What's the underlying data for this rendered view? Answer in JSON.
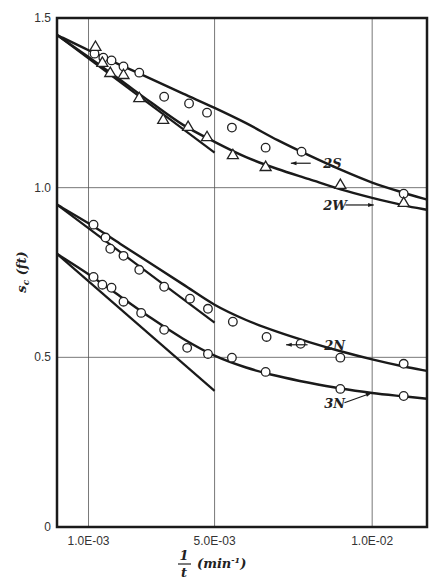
{
  "chart_data": {
    "type": "scatter",
    "title": "",
    "xlabel": "1/t (min^-1)",
    "xlabel_parts": {
      "numerator": "1",
      "denominator": "t",
      "unit": "(min",
      "exponent": "-1",
      "close": ")"
    },
    "ylabel": "s_c (ft)",
    "ylabel_parts": {
      "main": "s",
      "sub": "c",
      "unit": " (ft)"
    },
    "xlim": [
      0.0,
      0.01174
    ],
    "ylim": [
      0,
      1.5
    ],
    "grid": true,
    "x_ticks": [
      {
        "value": 0.001,
        "label": "1.0E-03"
      },
      {
        "value": 0.005,
        "label": "5.0E-03"
      },
      {
        "value": 0.01,
        "label": "1.0E-02"
      }
    ],
    "y_ticks": [
      {
        "value": 0,
        "label": "0"
      },
      {
        "value": 0.5,
        "label": "0.5"
      },
      {
        "value": 1.0,
        "label": "1.0"
      },
      {
        "value": 1.5,
        "label": "1.5"
      }
    ],
    "series": [
      {
        "name": "2S",
        "marker": "circle",
        "x": [
          0.00119,
          0.00147,
          0.00173,
          0.00211,
          0.00261,
          0.0034,
          0.00419,
          0.00476,
          0.00555,
          0.00662,
          0.00776,
          0.011
        ],
        "y": [
          1.395,
          1.383,
          1.375,
          1.357,
          1.339,
          1.268,
          1.248,
          1.221,
          1.177,
          1.118,
          1.106,
          0.982
        ],
        "curve": {
          "x": [
            0.0,
            0.001,
            0.002,
            0.003,
            0.004,
            0.005,
            0.006,
            0.007,
            0.008,
            0.009,
            0.01,
            0.011,
            0.01174
          ],
          "y": [
            1.45,
            1.405,
            1.362,
            1.32,
            1.277,
            1.235,
            1.19,
            1.14,
            1.095,
            1.053,
            1.015,
            0.985,
            0.965
          ]
        },
        "label_pos": {
          "x": 0.00845,
          "y": 1.072
        },
        "arrow": {
          "from": [
            0.00805,
            1.072
          ],
          "to": [
            0.00742,
            1.072
          ]
        }
      },
      {
        "name": "2W",
        "marker": "triangle",
        "x": [
          0.00122,
          0.00144,
          0.00169,
          0.00211,
          0.00261,
          0.00337,
          0.00416,
          0.00476,
          0.00558,
          0.00662,
          0.00899,
          0.011
        ],
        "y": [
          1.416,
          1.369,
          1.339,
          1.333,
          1.265,
          1.201,
          1.18,
          1.15,
          1.097,
          1.062,
          1.009,
          0.956
        ],
        "curve": {
          "x": [
            0.0,
            0.001,
            0.002,
            0.003,
            0.004,
            0.005,
            0.006,
            0.007,
            0.008,
            0.009,
            0.01,
            0.011,
            0.01174
          ],
          "y": [
            1.45,
            1.385,
            1.318,
            1.25,
            1.185,
            1.135,
            1.09,
            1.055,
            1.025,
            0.995,
            0.97,
            0.948,
            0.935
          ]
        },
        "label_pos": {
          "x": 0.00845,
          "y": 0.949
        },
        "arrow": {
          "from": [
            0.00915,
            0.949
          ],
          "to": [
            0.01005,
            0.949
          ]
        }
      },
      {
        "name": "2N",
        "marker": "circle",
        "x": [
          0.00116,
          0.00154,
          0.00169,
          0.00211,
          0.00261,
          0.0034,
          0.00422,
          0.00479,
          0.00558,
          0.00665,
          0.00773,
          0.00899,
          0.011
        ],
        "y": [
          0.891,
          0.853,
          0.82,
          0.799,
          0.758,
          0.708,
          0.673,
          0.643,
          0.605,
          0.56,
          0.54,
          0.499,
          0.481
        ],
        "curve": {
          "x": [
            0.0,
            0.001,
            0.002,
            0.003,
            0.004,
            0.005,
            0.006,
            0.007,
            0.008,
            0.009,
            0.01,
            0.011,
            0.01174
          ],
          "y": [
            0.95,
            0.895,
            0.835,
            0.775,
            0.715,
            0.655,
            0.61,
            0.575,
            0.545,
            0.518,
            0.494,
            0.473,
            0.46
          ]
        },
        "label_pos": {
          "x": 0.00848,
          "y": 0.537
        },
        "arrow": {
          "from": [
            0.00795,
            0.537
          ],
          "to": [
            0.00727,
            0.537
          ]
        }
      },
      {
        "name": "3N",
        "marker": "circle",
        "x": [
          0.00116,
          0.00144,
          0.00173,
          0.00211,
          0.00267,
          0.0034,
          0.00413,
          0.00479,
          0.00555,
          0.00662,
          0.00899,
          0.011
        ],
        "y": [
          0.737,
          0.714,
          0.705,
          0.664,
          0.631,
          0.581,
          0.528,
          0.51,
          0.499,
          0.457,
          0.407,
          0.386
        ],
        "curve": {
          "x": [
            0.0,
            0.001,
            0.002,
            0.003,
            0.004,
            0.005,
            0.006,
            0.007,
            0.008,
            0.009,
            0.01,
            0.011,
            0.01174
          ],
          "y": [
            0.805,
            0.745,
            0.68,
            0.615,
            0.555,
            0.505,
            0.47,
            0.445,
            0.425,
            0.408,
            0.395,
            0.385,
            0.378
          ]
        },
        "label_pos": {
          "x": 0.00848,
          "y": 0.366
        },
        "arrow": {
          "from": [
            0.00912,
            0.366
          ],
          "to": [
            0.00998,
            0.395
          ]
        }
      }
    ],
    "tangent_lines": [
      {
        "name": "2S/2W initial tangent",
        "from": [
          0.0,
          1.45
        ],
        "to": [
          0.005,
          1.103
        ]
      },
      {
        "name": "2N initial tangent",
        "from": [
          0.0,
          0.95
        ],
        "to": [
          0.005,
          0.602
        ]
      },
      {
        "name": "3N initial tangent",
        "from": [
          0.0,
          0.805
        ],
        "to": [
          0.005,
          0.401
        ]
      }
    ]
  },
  "colors": {
    "axis": "#1a1a1a",
    "grid": "#555555",
    "curve": "#1a1a1a",
    "marker_stroke": "#222222",
    "marker_fill": "#ffffff",
    "tick_text": "#333333"
  },
  "plot_area": {
    "left": 57,
    "top": 18,
    "right": 427,
    "bottom": 527
  }
}
